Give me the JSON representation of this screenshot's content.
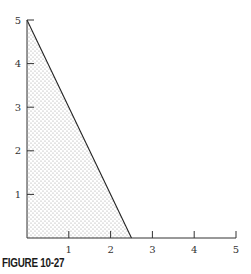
{
  "chart_data": {
    "type": "area",
    "title": "",
    "caption": "FIGURE 10-27",
    "xlabel": "",
    "ylabel": "",
    "xlim": [
      0,
      5
    ],
    "ylim": [
      0,
      5
    ],
    "x_ticks": [
      1,
      2,
      3,
      4,
      5
    ],
    "y_ticks": [
      1,
      2,
      3,
      4,
      5
    ],
    "grid": false,
    "legend": null,
    "series": [
      {
        "name": "feasible region",
        "style": "stippled fill, bounded by axes and line",
        "polygon": [
          [
            0,
            0
          ],
          [
            0,
            5
          ],
          [
            2.5,
            0
          ]
        ]
      },
      {
        "name": "boundary line",
        "type": "line",
        "x": [
          0,
          2.5
        ],
        "y": [
          5,
          0
        ]
      }
    ]
  },
  "figure": {
    "caption": "FIGURE 10-27",
    "x_tick_labels": [
      "1",
      "2",
      "3",
      "4",
      "5"
    ],
    "y_tick_labels": [
      "1",
      "2",
      "3",
      "4",
      "5"
    ],
    "colors": {
      "axis": "#333333",
      "fill_dot": "#9a9a9a",
      "line": "#222222"
    }
  }
}
